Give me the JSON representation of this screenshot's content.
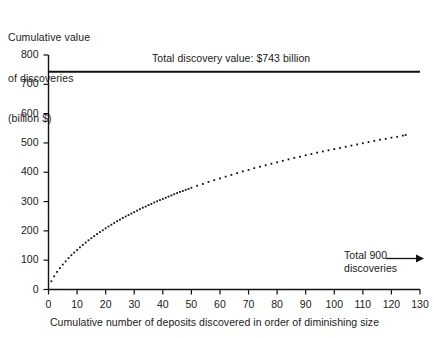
{
  "chart_data": {
    "type": "line",
    "title": "",
    "ylabel": "Cumulative value\nof discoveries\n(billion $)",
    "ylabel_lines": [
      "Cumulative value",
      "of discoveries",
      "(billion $)"
    ],
    "xlabel": "Cumulative number of deposits discovered in order of diminishing size",
    "xlim": [
      0,
      130
    ],
    "ylim": [
      0,
      800
    ],
    "xticks": [
      0,
      10,
      20,
      30,
      40,
      50,
      60,
      70,
      80,
      90,
      100,
      110,
      120,
      130
    ],
    "yticks": [
      0,
      100,
      200,
      300,
      400,
      500,
      600,
      700,
      800
    ],
    "xtick_labels": [
      "0",
      "10",
      "20",
      "30",
      "40",
      "50",
      "60",
      "70",
      "80",
      "90",
      "100",
      "110",
      "120",
      "130"
    ],
    "ytick_labels": [
      "0",
      "100",
      "200",
      "300",
      "400",
      "500",
      "600",
      "700",
      "800"
    ],
    "grid": false,
    "legend": "none",
    "series": [
      {
        "name": "Cumulative value of discoveries",
        "style": "dotted",
        "color": "#111111",
        "x": [
          1,
          2,
          3,
          4,
          5,
          6,
          7,
          8,
          9,
          10,
          11,
          12,
          13,
          14,
          15,
          16,
          17,
          18,
          19,
          20,
          21,
          22,
          23,
          24,
          25,
          26,
          27,
          28,
          29,
          30,
          31,
          32,
          33,
          34,
          35,
          36,
          37,
          38,
          39,
          40,
          41,
          42,
          43,
          44,
          45,
          46,
          47,
          48,
          49,
          50,
          52,
          54,
          56,
          58,
          60,
          62,
          64,
          66,
          68,
          70,
          72,
          74,
          76,
          78,
          80,
          82,
          84,
          86,
          88,
          90,
          92,
          94,
          96,
          98,
          100,
          102,
          104,
          106,
          108,
          110,
          112,
          114,
          116,
          118,
          120,
          122,
          124,
          125
        ],
        "y": [
          28,
          45,
          60,
          73,
          85,
          96,
          107,
          117,
          126,
          135,
          144,
          152,
          160,
          168,
          175,
          182,
          189,
          196,
          202,
          209,
          215,
          221,
          227,
          233,
          238,
          244,
          249,
          254,
          259,
          264,
          269,
          274,
          279,
          283,
          288,
          292,
          297,
          301,
          305,
          309,
          313,
          317,
          321,
          325,
          329,
          333,
          336,
          340,
          343,
          347,
          354,
          360,
          367,
          373,
          379,
          385,
          391,
          397,
          403,
          408,
          414,
          419,
          424,
          429,
          434,
          439,
          444,
          449,
          453,
          458,
          462,
          467,
          471,
          475,
          479,
          483,
          487,
          491,
          495,
          499,
          503,
          507,
          511,
          514,
          518,
          521,
          525,
          527
        ]
      }
    ],
    "reference_lines": [
      {
        "name": "total-discovery-value",
        "orientation": "horizontal",
        "value": 743,
        "label": "Total discovery value: $743 billion"
      }
    ],
    "annotations": [
      {
        "name": "total-discovery-value-label",
        "text": "Total discovery value: $743 billion"
      },
      {
        "name": "total-discoveries-label",
        "line1": "Total 900",
        "line2": "discoveries",
        "arrow": "right-arrow"
      }
    ]
  },
  "axis": {
    "ylabel_line1": "Cumulative value",
    "ylabel_line2": "of discoveries",
    "ylabel_line3": "(billion $)",
    "xlabel": "Cumulative number of deposits discovered in order of diminishing size"
  },
  "annotations": {
    "total_value": "Total discovery value: $743 billion",
    "total_discoveries_line1": "Total 900",
    "total_discoveries_line2": "discoveries"
  },
  "colors": {
    "ink": "#111111",
    "background": "#ffffff"
  }
}
